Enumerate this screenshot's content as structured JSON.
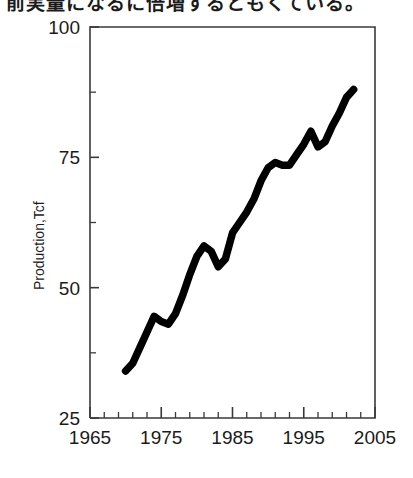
{
  "caption": {
    "text": "前実量になるに倍増するともくている。"
  },
  "chart_data": {
    "type": "line",
    "title": "",
    "subtitle": "",
    "xlabel": "",
    "ylabel": "Production,Tcf",
    "xlim": [
      1965,
      2005
    ],
    "ylim": [
      25,
      100
    ],
    "x_ticks": [
      1965,
      1975,
      1985,
      1995,
      2005
    ],
    "x_tick_labels": [
      "1965",
      "1975",
      "1985",
      "1995",
      "2005"
    ],
    "x_minor_step": 2,
    "y_ticks": [
      25,
      50,
      75,
      100
    ],
    "y_tick_labels": [
      "25",
      "50",
      "75",
      "100"
    ],
    "grid": false,
    "legend": null,
    "annotations": [],
    "series": [
      {
        "name": "Production",
        "color": "#000000",
        "x": [
          1970,
          1971,
          1972,
          1973,
          1974,
          1975,
          1976,
          1977,
          1978,
          1979,
          1980,
          1981,
          1982,
          1983,
          1984,
          1985,
          1986,
          1987,
          1988,
          1989,
          1990,
          1991,
          1992,
          1993,
          1994,
          1995,
          1996,
          1997,
          1998,
          1999,
          2000,
          2001,
          2002
        ],
        "values": [
          34.0,
          35.5,
          38.5,
          41.5,
          44.5,
          43.5,
          43.0,
          45.0,
          48.5,
          52.5,
          56.0,
          58.0,
          57.0,
          54.0,
          55.5,
          60.5,
          62.5,
          64.5,
          67.0,
          70.5,
          73.0,
          74.0,
          73.5,
          73.5,
          75.5,
          77.5,
          80.0,
          77.0,
          78.0,
          81.0,
          83.5,
          86.5,
          88.0
        ]
      }
    ]
  }
}
